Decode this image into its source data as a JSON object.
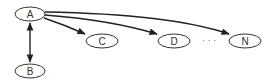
{
  "diagram": {
    "nodes": [
      {
        "id": "A",
        "label": "A",
        "cx": 30,
        "cy": 14,
        "rx": 15,
        "ry": 7
      },
      {
        "id": "B",
        "label": "B",
        "cx": 30,
        "cy": 71,
        "rx": 15,
        "ry": 7
      },
      {
        "id": "C",
        "label": "C",
        "cx": 102,
        "cy": 41,
        "rx": 16,
        "ry": 7
      },
      {
        "id": "D",
        "label": "D",
        "cx": 174,
        "cy": 41,
        "rx": 16,
        "ry": 7
      },
      {
        "id": "N",
        "label": "N",
        "cx": 245,
        "cy": 41,
        "rx": 16,
        "ry": 7
      }
    ],
    "edges": [
      {
        "from": "A",
        "to": "B",
        "type": "bidirectional"
      },
      {
        "from": "A",
        "to": "C",
        "type": "directed"
      },
      {
        "from": "A",
        "to": "D",
        "type": "directed"
      },
      {
        "from": "A",
        "to": "N",
        "type": "directed"
      }
    ],
    "ellipsis": "· · ·",
    "colors": {
      "stroke": "#333333",
      "fill": "#ffffff",
      "text": "#333333"
    }
  }
}
